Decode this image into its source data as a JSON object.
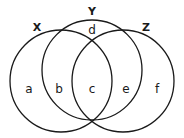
{
  "diagram": {
    "type": "venn",
    "sets": [
      {
        "id": "X",
        "label": "X",
        "cx": 61,
        "cy": 81,
        "r": 51,
        "label_x": 37,
        "label_y": 28
      },
      {
        "id": "Y",
        "label": "Y",
        "cx": 92,
        "cy": 70,
        "r": 50,
        "label_x": 92,
        "label_y": 12
      },
      {
        "id": "Z",
        "label": "Z",
        "cx": 123,
        "cy": 81,
        "r": 51,
        "label_x": 146,
        "label_y": 28
      }
    ],
    "regions": [
      {
        "id": "a",
        "label": "a",
        "x": 29,
        "y": 89
      },
      {
        "id": "b",
        "label": "b",
        "x": 59,
        "y": 89
      },
      {
        "id": "c",
        "label": "c",
        "x": 92,
        "y": 89
      },
      {
        "id": "d",
        "label": "d",
        "x": 92,
        "y": 30
      },
      {
        "id": "e",
        "label": "e",
        "x": 126,
        "y": 89
      },
      {
        "id": "f",
        "label": "f",
        "x": 157,
        "y": 89
      }
    ],
    "stroke_color": "#1a1a1a",
    "background": "#ffffff"
  }
}
